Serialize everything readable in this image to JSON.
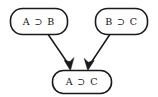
{
  "diagram": {
    "type": "inference-diagram",
    "background_color": "#ffffff",
    "line_color": "#1a1a1a",
    "text_color": "#111111",
    "nodes": [
      {
        "id": "premise-1",
        "label": "A ⊃ B",
        "role": "premise",
        "shape": "rounded-rectangle",
        "x": 10,
        "y": 8,
        "width": 58,
        "height": 27
      },
      {
        "id": "premise-2",
        "label": "B ⊃ C",
        "role": "premise",
        "shape": "rounded-rectangle",
        "x": 95,
        "y": 8,
        "width": 53,
        "height": 27
      },
      {
        "id": "conclusion",
        "label": "A ⊃ C",
        "role": "conclusion",
        "shape": "rounded-rectangle",
        "x": 52,
        "y": 70,
        "width": 60,
        "height": 24
      }
    ],
    "edges": [
      {
        "id": "edge-premise-1-to-conclusion",
        "from": "premise-1",
        "to": "conclusion",
        "arrowhead": "filled-triangle",
        "x1": 47,
        "y1": 33,
        "x2": 70,
        "y2": 70
      },
      {
        "id": "edge-premise-2-to-conclusion",
        "from": "premise-2",
        "to": "conclusion",
        "arrowhead": "filled-triangle",
        "x1": 110,
        "y1": 33,
        "x2": 88,
        "y2": 70
      }
    ]
  }
}
